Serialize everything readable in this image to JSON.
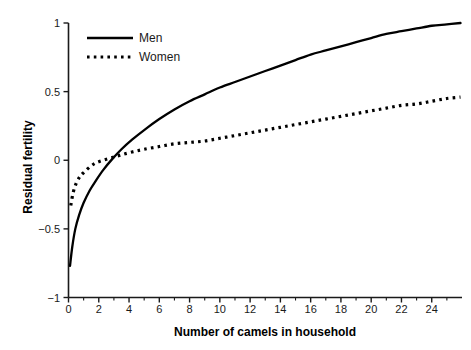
{
  "chart_data": {
    "type": "line",
    "title": "",
    "xlabel": "Number of camels in household",
    "ylabel": "Residual fertility",
    "xlim": [
      0,
      26
    ],
    "ylim": [
      -1,
      1
    ],
    "grid": false,
    "legend_position": "top-left",
    "xticks": [
      0,
      2,
      4,
      6,
      8,
      10,
      12,
      14,
      16,
      18,
      20,
      22,
      24
    ],
    "xtick_labels": [
      "0",
      "2",
      "4",
      "6",
      "8",
      "10",
      "12",
      "14",
      "16",
      "18",
      "20",
      "22",
      "24"
    ],
    "x_minor_ticks": [
      1,
      3,
      5,
      7,
      9,
      11,
      13,
      15,
      17,
      19,
      21,
      23,
      25
    ],
    "yticks": [
      -1,
      -0.5,
      0,
      0.5,
      1
    ],
    "ytick_labels": [
      "−1",
      "−0.5",
      "0",
      "0.5",
      "1"
    ],
    "series": [
      {
        "name": "Men",
        "style": "solid",
        "color": "#000000",
        "x": [
          0.1,
          0.25,
          0.45,
          0.7,
          1.0,
          1.4,
          1.8,
          2.3,
          2.9,
          3.5,
          4.2,
          5.0,
          6.0,
          7.0,
          8.0,
          9.0,
          10.0,
          11.0,
          12.0,
          13.0,
          14.0,
          15.0,
          16.0,
          17.0,
          18.0,
          19.0,
          20.0,
          21.0,
          22.0,
          23.0,
          24.0,
          25.0,
          25.9
        ],
        "y": [
          -0.77,
          -0.63,
          -0.5,
          -0.4,
          -0.31,
          -0.22,
          -0.15,
          -0.07,
          0.01,
          0.08,
          0.15,
          0.22,
          0.3,
          0.37,
          0.43,
          0.48,
          0.53,
          0.57,
          0.61,
          0.65,
          0.69,
          0.73,
          0.77,
          0.8,
          0.83,
          0.86,
          0.89,
          0.92,
          0.94,
          0.96,
          0.98,
          0.99,
          1.0
        ]
      },
      {
        "name": "Women",
        "style": "dotted",
        "color": "#000000",
        "x": [
          0.15,
          0.3,
          0.5,
          0.75,
          1.0,
          1.4,
          1.8,
          2.3,
          2.9,
          3.5,
          4.2,
          5.0,
          6.0,
          7.0,
          8.0,
          9.0,
          10.0,
          11.0,
          12.0,
          13.0,
          14.0,
          15.0,
          16.0,
          17.0,
          18.0,
          19.0,
          20.0,
          21.0,
          22.0,
          23.0,
          24.0,
          25.0,
          25.9
        ],
        "y": [
          -0.33,
          -0.24,
          -0.17,
          -0.12,
          -0.09,
          -0.05,
          -0.02,
          0.0,
          0.02,
          0.04,
          0.06,
          0.08,
          0.1,
          0.12,
          0.13,
          0.14,
          0.16,
          0.18,
          0.2,
          0.22,
          0.24,
          0.26,
          0.28,
          0.3,
          0.32,
          0.34,
          0.36,
          0.38,
          0.4,
          0.41,
          0.43,
          0.45,
          0.46
        ]
      }
    ]
  },
  "legend": {
    "items": [
      {
        "label": "Men",
        "style": "solid"
      },
      {
        "label": "Women",
        "style": "dotted"
      }
    ]
  },
  "axes": {
    "x_title": "Number of camels in household",
    "y_title": "Residual fertility"
  }
}
